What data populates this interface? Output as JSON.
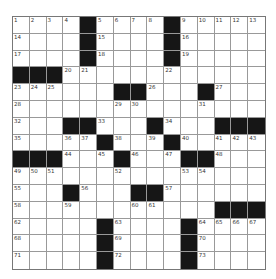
{
  "puzzle": {
    "type": "crossword",
    "rows": 15,
    "cols": 15,
    "colors": {
      "block": "#161616",
      "cell": "#ffffff",
      "line": "#999999"
    },
    "layout": [
      "....#....#.....",
      "....#....#.....",
      "....#....#.....",
      "###............",
      "......##...#...",
      "...............",
      "...##...#...###",
      ".....#...#.....",
      "###...#...##...",
      "...............",
      "...#...##......",
      "............###",
      ".....#....#....",
      ".....#....#....",
      ".....#....#...."
    ],
    "numbers": [
      {
        "r": 0,
        "c": 0,
        "n": "1"
      },
      {
        "r": 0,
        "c": 1,
        "n": "2"
      },
      {
        "r": 0,
        "c": 2,
        "n": "3"
      },
      {
        "r": 0,
        "c": 3,
        "n": "4"
      },
      {
        "r": 0,
        "c": 5,
        "n": "5"
      },
      {
        "r": 0,
        "c": 6,
        "n": "6"
      },
      {
        "r": 0,
        "c": 7,
        "n": "7"
      },
      {
        "r": 0,
        "c": 8,
        "n": "8"
      },
      {
        "r": 0,
        "c": 10,
        "n": "9"
      },
      {
        "r": 0,
        "c": 11,
        "n": "10"
      },
      {
        "r": 0,
        "c": 12,
        "n": "11"
      },
      {
        "r": 0,
        "c": 13,
        "n": "12"
      },
      {
        "r": 0,
        "c": 14,
        "n": "13"
      },
      {
        "r": 1,
        "c": 0,
        "n": "14"
      },
      {
        "r": 1,
        "c": 5,
        "n": "15"
      },
      {
        "r": 1,
        "c": 10,
        "n": "16"
      },
      {
        "r": 2,
        "c": 0,
        "n": "17"
      },
      {
        "r": 2,
        "c": 5,
        "n": "18"
      },
      {
        "r": 2,
        "c": 10,
        "n": "19"
      },
      {
        "r": 3,
        "c": 3,
        "n": "20"
      },
      {
        "r": 3,
        "c": 4,
        "n": "21"
      },
      {
        "r": 3,
        "c": 9,
        "n": "22"
      },
      {
        "r": 4,
        "c": 0,
        "n": "23"
      },
      {
        "r": 4,
        "c": 1,
        "n": "24"
      },
      {
        "r": 4,
        "c": 2,
        "n": "25"
      },
      {
        "r": 4,
        "c": 8,
        "n": "26"
      },
      {
        "r": 4,
        "c": 12,
        "n": "27"
      },
      {
        "r": 5,
        "c": 0,
        "n": "28"
      },
      {
        "r": 5,
        "c": 6,
        "n": "29"
      },
      {
        "r": 5,
        "c": 7,
        "n": "30"
      },
      {
        "r": 5,
        "c": 11,
        "n": "31"
      },
      {
        "r": 6,
        "c": 0,
        "n": "32"
      },
      {
        "r": 6,
        "c": 5,
        "n": "33"
      },
      {
        "r": 6,
        "c": 9,
        "n": "34"
      },
      {
        "r": 7,
        "c": 0,
        "n": "35"
      },
      {
        "r": 7,
        "c": 3,
        "n": "36"
      },
      {
        "r": 7,
        "c": 4,
        "n": "37"
      },
      {
        "r": 7,
        "c": 6,
        "n": "38"
      },
      {
        "r": 7,
        "c": 8,
        "n": "39"
      },
      {
        "r": 7,
        "c": 10,
        "n": "40"
      },
      {
        "r": 7,
        "c": 12,
        "n": "41"
      },
      {
        "r": 7,
        "c": 13,
        "n": "42"
      },
      {
        "r": 7,
        "c": 14,
        "n": "43"
      },
      {
        "r": 8,
        "c": 3,
        "n": "44"
      },
      {
        "r": 8,
        "c": 5,
        "n": "45"
      },
      {
        "r": 8,
        "c": 7,
        "n": "46"
      },
      {
        "r": 8,
        "c": 9,
        "n": "47"
      },
      {
        "r": 8,
        "c": 12,
        "n": "48"
      },
      {
        "r": 9,
        "c": 0,
        "n": "49"
      },
      {
        "r": 9,
        "c": 1,
        "n": "50"
      },
      {
        "r": 9,
        "c": 2,
        "n": "51"
      },
      {
        "r": 9,
        "c": 6,
        "n": "52"
      },
      {
        "r": 9,
        "c": 10,
        "n": "53"
      },
      {
        "r": 9,
        "c": 11,
        "n": "54"
      },
      {
        "r": 10,
        "c": 0,
        "n": "55"
      },
      {
        "r": 10,
        "c": 4,
        "n": "56"
      },
      {
        "r": 10,
        "c": 9,
        "n": "57"
      },
      {
        "r": 11,
        "c": 0,
        "n": "58"
      },
      {
        "r": 11,
        "c": 3,
        "n": "59"
      },
      {
        "r": 11,
        "c": 7,
        "n": "60"
      },
      {
        "r": 11,
        "c": 8,
        "n": "61"
      },
      {
        "r": 12,
        "c": 0,
        "n": "62"
      },
      {
        "r": 12,
        "c": 6,
        "n": "63"
      },
      {
        "r": 12,
        "c": 11,
        "n": "64"
      },
      {
        "r": 12,
        "c": 12,
        "n": "65"
      },
      {
        "r": 12,
        "c": 13,
        "n": "66"
      },
      {
        "r": 12,
        "c": 14,
        "n": "67"
      },
      {
        "r": 13,
        "c": 0,
        "n": "68"
      },
      {
        "r": 13,
        "c": 6,
        "n": "69"
      },
      {
        "r": 13,
        "c": 11,
        "n": "70"
      },
      {
        "r": 14,
        "c": 0,
        "n": "71"
      },
      {
        "r": 14,
        "c": 6,
        "n": "72"
      },
      {
        "r": 14,
        "c": 11,
        "n": "73"
      }
    ]
  }
}
